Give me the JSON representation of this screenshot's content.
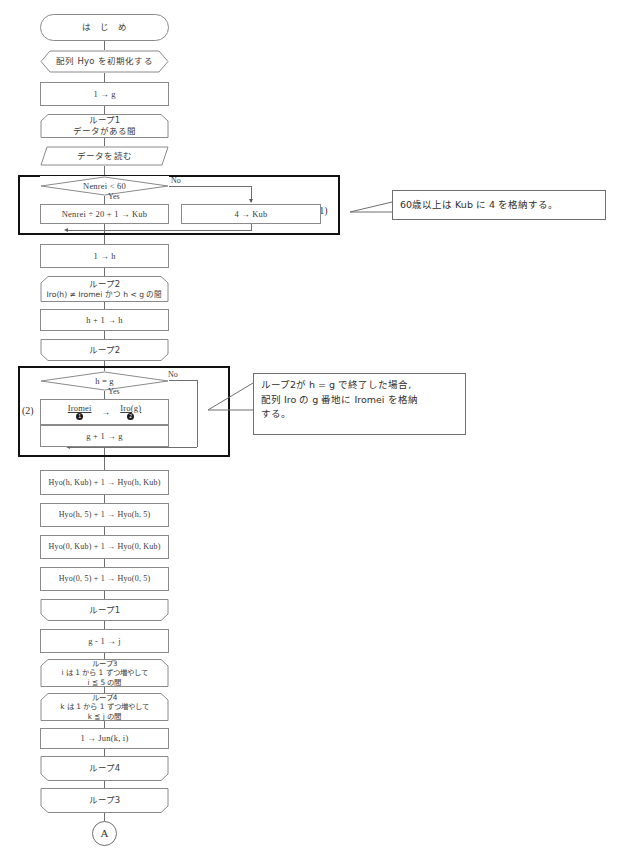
{
  "diagram": {
    "nodes": {
      "start": "は　じ　め",
      "init_hyo": "配列 Hyo を初期化する",
      "assign_g": "1 → g",
      "loop1_start_line1": "ループ1",
      "loop1_start_line2": "データがある間",
      "read_data": "データを読む",
      "decision_nenrei": "Nenrei < 60",
      "branch_yes": "Yes",
      "branch_no": "No",
      "calc_kub": "Nenrei ÷ 20 + 1 → Kub",
      "set_kub4": "4 → Kub",
      "assign_h": "1 → h",
      "loop2_start_line1": "ループ2",
      "loop2_start_line2": "Iro(h) ≠ Iromei かつ h < g の間",
      "increment_h": "h + 1 → h",
      "loop2_end": "ループ2",
      "decision_hg": "h = g",
      "store_iro_left": "Iromei",
      "store_iro_arrow": "→",
      "store_iro_right": "Iro(g)",
      "store_iro_mark1": "1",
      "store_iro_mark2": "2",
      "increment_g": "g + 1 → g",
      "hyo_h_kub": "Hyo(h, Kub) + 1 → Hyo(h, Kub)",
      "hyo_h_5": "Hyo(h, 5) + 1 → Hyo(h, 5)",
      "hyo_0_kub": "Hyo(0, Kub) + 1 → Hyo(0, Kub)",
      "hyo_0_5": "Hyo(0, 5) + 1 → Hyo(0, 5)",
      "loop1_end": "ループ1",
      "assign_j": "g - 1 → j",
      "loop3_start_line1": "ループ3",
      "loop3_start_line2": "i は 1 から 1 ずつ増やして",
      "loop3_start_line3": "i ≦ 5 の間",
      "loop4_start_line1": "ループ4",
      "loop4_start_line2": "k は 1 から 1 ずつ増やして",
      "loop4_start_line3": "k ≦ j の間",
      "assign_jun": "1 → Jun(k, i)",
      "loop4_end": "ループ4",
      "loop3_end": "ループ3",
      "connector_a": "A"
    },
    "groups": [
      {
        "tag": "(1)"
      },
      {
        "tag": "(2)"
      }
    ],
    "notes": {
      "note1": "60歳以上は Kub に 4 を格納する。",
      "note2_line1": "ループ2が h = g で終了した場合,",
      "note2_line2": "配列 Iro の g 番地に Iromei を格納",
      "note2_line3": "する。"
    },
    "colors": {
      "stroke": "#8a8a8a",
      "group_stroke": "#111111",
      "text": "#3a3a3a",
      "background": "#ffffff"
    }
  }
}
